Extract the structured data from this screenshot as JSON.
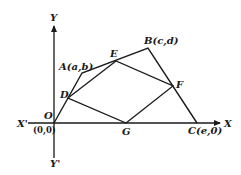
{
  "diagram": {
    "axes": {
      "x_label": "X",
      "x_neg_label": "X'",
      "y_label": "Y",
      "y_neg_label": "Y'"
    },
    "points": {
      "O": {
        "label": "O",
        "coord_label": "(0,0)"
      },
      "A": {
        "label": "A(a,b)"
      },
      "B": {
        "label": "B(c,d)"
      },
      "C": {
        "label": "C(e,0)"
      },
      "D": {
        "label": "D"
      },
      "E": {
        "label": "E"
      },
      "F": {
        "label": "F"
      },
      "G": {
        "label": "G"
      }
    },
    "colors": {
      "stroke": "#1a1a1a",
      "background": "#ffffff"
    }
  }
}
